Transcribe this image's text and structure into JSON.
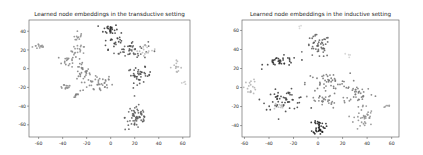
{
  "chart_data": [
    {
      "type": "scatter",
      "title": "Learned node embeddings in the transductive setting",
      "xlabel": "",
      "ylabel": "",
      "xlim": [
        -68,
        66
      ],
      "ylim": [
        -73,
        52
      ],
      "xticks": [
        -60,
        -40,
        -20,
        0,
        20,
        40,
        60
      ],
      "yticks": [
        40,
        20,
        0,
        -20,
        -40,
        -60
      ],
      "grid": false,
      "legend": null,
      "clusters": [
        {
          "label": "cluster-a",
          "color": "#909090",
          "cx": -59,
          "cy": 24,
          "sx": 3,
          "sy": 1.5,
          "n": 14
        },
        {
          "label": "cluster-b",
          "color": "#8a8a8a",
          "cx": -27,
          "cy": 32,
          "sx": 2,
          "sy": 4,
          "n": 14
        },
        {
          "label": "cluster-c",
          "color": "#8c8c8c",
          "cx": -27,
          "cy": 19,
          "sx": 3,
          "sy": 3,
          "n": 16
        },
        {
          "label": "cluster-d",
          "color": "#7e7e7e",
          "cx": -35,
          "cy": 8,
          "sx": 4,
          "sy": 3,
          "n": 18
        },
        {
          "label": "cluster-e",
          "color": "#7a7a7a",
          "cx": -24,
          "cy": -2,
          "sx": 3,
          "sy": 5,
          "n": 24
        },
        {
          "label": "cluster-f",
          "color": "#808080",
          "cx": -12,
          "cy": -16,
          "sx": 7,
          "sy": 5,
          "n": 45
        },
        {
          "label": "cluster-g",
          "color": "#888888",
          "cx": -38,
          "cy": -19,
          "sx": 3,
          "sy": 1.5,
          "n": 12
        },
        {
          "label": "cluster-h",
          "color": "#7e7e7e",
          "cx": -29,
          "cy": -28,
          "sx": 1.5,
          "sy": 2,
          "n": 8
        },
        {
          "label": "cluster-i",
          "color": "#2e2e2e",
          "cx": 0,
          "cy": 42,
          "sx": 3,
          "sy": 3,
          "n": 26
        },
        {
          "label": "cluster-j",
          "color": "#3a3a3a",
          "cx": 4,
          "cy": 29,
          "sx": 6,
          "sy": 4,
          "n": 24
        },
        {
          "label": "cluster-k",
          "color": "#555555",
          "cx": 17,
          "cy": 20,
          "sx": 7,
          "sy": 5,
          "n": 42
        },
        {
          "label": "cluster-l",
          "color": "#b8b8b8",
          "cx": 30,
          "cy": 20,
          "sx": 4,
          "sy": 3,
          "n": 16
        },
        {
          "label": "cluster-m",
          "color": "#484848",
          "cx": 24,
          "cy": -7,
          "sx": 5,
          "sy": 4,
          "n": 40
        },
        {
          "label": "cluster-n",
          "color": "#b0b0b0",
          "cx": 54,
          "cy": 2,
          "sx": 2.5,
          "sy": 3,
          "n": 14
        },
        {
          "label": "cluster-o",
          "color": "#c4c4c4",
          "cx": 60,
          "cy": -14,
          "sx": 1,
          "sy": 1,
          "n": 4
        },
        {
          "label": "cluster-p",
          "color": "#5a5a5a",
          "cx": 22,
          "cy": -52,
          "sx": 5,
          "sy": 7,
          "n": 60
        }
      ]
    },
    {
      "type": "scatter",
      "title": "Learned node embeddings in the inductive setting",
      "xlabel": "",
      "ylabel": "",
      "xlim": [
        -62,
        66
      ],
      "ylim": [
        -52,
        71
      ],
      "xticks": [
        -60,
        -40,
        -20,
        0,
        20,
        40,
        60
      ],
      "yticks": [
        60,
        40,
        20,
        0,
        -20,
        -40
      ],
      "grid": false,
      "legend": null,
      "clusters": [
        {
          "label": "cluster-a",
          "color": "#5a5a5a",
          "cx": 0,
          "cy": 43,
          "sx": 5,
          "sy": 6,
          "n": 48
        },
        {
          "label": "cluster-b",
          "color": "#2e2e2e",
          "cx": -30,
          "cy": 27,
          "sx": 7,
          "sy": 3,
          "n": 36
        },
        {
          "label": "cluster-c",
          "color": "#d2d2d2",
          "cx": -14,
          "cy": 64,
          "sx": 1,
          "sy": 1,
          "n": 3
        },
        {
          "label": "cluster-d",
          "color": "#d0d0d0",
          "cx": 25,
          "cy": 34,
          "sx": 1,
          "sy": 1.5,
          "n": 4
        },
        {
          "label": "cluster-e",
          "color": "#b0b0b0",
          "cx": -55,
          "cy": 1,
          "sx": 2.5,
          "sy": 4,
          "n": 18
        },
        {
          "label": "cluster-f",
          "color": "#3a3a3a",
          "cx": -27,
          "cy": -13,
          "sx": 9,
          "sy": 5,
          "n": 55
        },
        {
          "label": "cluster-g",
          "color": "#bcbcbc",
          "cx": -33,
          "cy": -20,
          "sx": 3,
          "sy": 2,
          "n": 10
        },
        {
          "label": "cluster-h",
          "color": "#6e6e6e",
          "cx": 8,
          "cy": 5,
          "sx": 9,
          "sy": 5,
          "n": 48
        },
        {
          "label": "cluster-i",
          "color": "#7a7a7a",
          "cx": 6,
          "cy": -14,
          "sx": 9,
          "sy": 4,
          "n": 30
        },
        {
          "label": "cluster-j",
          "color": "#777777",
          "cx": 34,
          "cy": -6,
          "sx": 6,
          "sy": 5,
          "n": 34
        },
        {
          "label": "cluster-k",
          "color": "#8c8c8c",
          "cx": 37,
          "cy": -32,
          "sx": 4,
          "sy": 7,
          "n": 36
        },
        {
          "label": "cluster-l",
          "color": "#1e1e1e",
          "cx": 1,
          "cy": -41,
          "sx": 2.5,
          "sy": 4,
          "n": 40
        },
        {
          "label": "cluster-m",
          "color": "#9a9a9a",
          "cx": 56,
          "cy": -20,
          "sx": 2,
          "sy": 1,
          "n": 6
        }
      ]
    }
  ]
}
